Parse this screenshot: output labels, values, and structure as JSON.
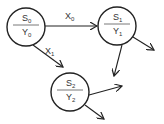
{
  "diagram": {
    "type": "state-machine",
    "stroke_color": "#222222",
    "nodes": [
      {
        "id": "S0",
        "state": "S",
        "state_sub": "0",
        "output": "Y",
        "output_sub": "0",
        "cx": 26,
        "cy": 27,
        "r": 19
      },
      {
        "id": "S1",
        "state": "S",
        "state_sub": "1",
        "output": "Y",
        "output_sub": "1",
        "cx": 117,
        "cy": 26,
        "r": 19
      },
      {
        "id": "S2",
        "state": "S",
        "state_sub": "2",
        "output": "Y",
        "output_sub": "2",
        "cx": 70,
        "cy": 92,
        "r": 19
      }
    ],
    "edges": [
      {
        "from": "S0",
        "to": "S1",
        "label": "X",
        "label_sub": "0"
      },
      {
        "from": "S0",
        "to": "S2",
        "label": "X",
        "label_sub": "1"
      },
      {
        "from": "S1",
        "to": null,
        "label": ""
      },
      {
        "from": "S1",
        "to": null,
        "label": ""
      },
      {
        "from": "S2",
        "to": null,
        "label": ""
      },
      {
        "from": "S2",
        "to": null,
        "label": ""
      }
    ]
  }
}
